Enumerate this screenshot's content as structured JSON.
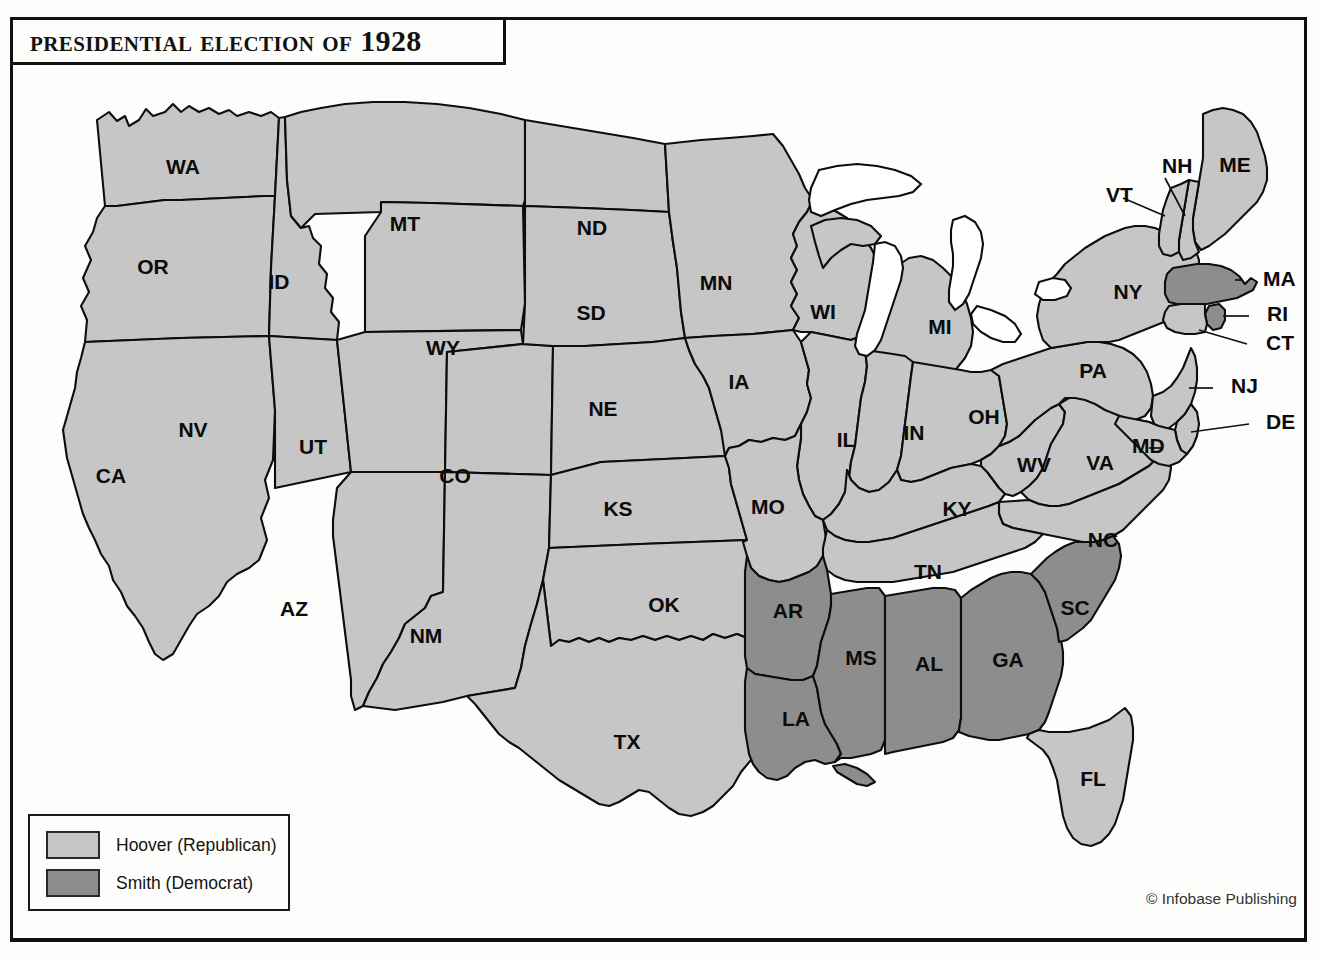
{
  "title": "Presidential Election of 1928",
  "credit": "© Infobase Publishing",
  "legend": {
    "items": [
      {
        "label": "Hoover (Republican)",
        "color": "#c6c6c6",
        "party": "Republican",
        "candidate": "Hoover"
      },
      {
        "label": "Smith (Democrat)",
        "color": "#8d8d8d",
        "party": "Democrat",
        "candidate": "Smith"
      }
    ]
  },
  "chart_data": {
    "type": "map",
    "title": "Presidential Election of 1928",
    "legend_position": "bottom-left",
    "categories": [
      "Hoover (Republican)",
      "Smith (Democrat)"
    ],
    "colors": {
      "Hoover (Republican)": "#c6c6c6",
      "Smith (Democrat)": "#8d8d8d"
    },
    "counts": {
      "Hoover (Republican)": 40,
      "Smith (Democrat)": 8
    },
    "states": [
      {
        "code": "WA",
        "winner": "Hoover (Republican)"
      },
      {
        "code": "OR",
        "winner": "Hoover (Republican)"
      },
      {
        "code": "CA",
        "winner": "Hoover (Republican)"
      },
      {
        "code": "ID",
        "winner": "Hoover (Republican)"
      },
      {
        "code": "NV",
        "winner": "Hoover (Republican)"
      },
      {
        "code": "MT",
        "winner": "Hoover (Republican)"
      },
      {
        "code": "WY",
        "winner": "Hoover (Republican)"
      },
      {
        "code": "UT",
        "winner": "Hoover (Republican)"
      },
      {
        "code": "AZ",
        "winner": "Hoover (Republican)"
      },
      {
        "code": "CO",
        "winner": "Hoover (Republican)"
      },
      {
        "code": "NM",
        "winner": "Hoover (Republican)"
      },
      {
        "code": "ND",
        "winner": "Hoover (Republican)"
      },
      {
        "code": "SD",
        "winner": "Hoover (Republican)"
      },
      {
        "code": "NE",
        "winner": "Hoover (Republican)"
      },
      {
        "code": "KS",
        "winner": "Hoover (Republican)"
      },
      {
        "code": "OK",
        "winner": "Hoover (Republican)"
      },
      {
        "code": "TX",
        "winner": "Hoover (Republican)"
      },
      {
        "code": "MN",
        "winner": "Hoover (Republican)"
      },
      {
        "code": "IA",
        "winner": "Hoover (Republican)"
      },
      {
        "code": "MO",
        "winner": "Hoover (Republican)"
      },
      {
        "code": "AR",
        "winner": "Smith (Democrat)"
      },
      {
        "code": "LA",
        "winner": "Smith (Democrat)"
      },
      {
        "code": "WI",
        "winner": "Hoover (Republican)"
      },
      {
        "code": "IL",
        "winner": "Hoover (Republican)"
      },
      {
        "code": "MS",
        "winner": "Smith (Democrat)"
      },
      {
        "code": "MI",
        "winner": "Hoover (Republican)"
      },
      {
        "code": "IN",
        "winner": "Hoover (Republican)"
      },
      {
        "code": "KY",
        "winner": "Hoover (Republican)"
      },
      {
        "code": "TN",
        "winner": "Hoover (Republican)"
      },
      {
        "code": "AL",
        "winner": "Smith (Democrat)"
      },
      {
        "code": "OH",
        "winner": "Hoover (Republican)"
      },
      {
        "code": "WV",
        "winner": "Hoover (Republican)"
      },
      {
        "code": "GA",
        "winner": "Smith (Democrat)"
      },
      {
        "code": "FL",
        "winner": "Hoover (Republican)"
      },
      {
        "code": "SC",
        "winner": "Smith (Democrat)"
      },
      {
        "code": "NC",
        "winner": "Hoover (Republican)"
      },
      {
        "code": "VA",
        "winner": "Hoover (Republican)"
      },
      {
        "code": "PA",
        "winner": "Hoover (Republican)"
      },
      {
        "code": "NY",
        "winner": "Hoover (Republican)"
      },
      {
        "code": "ME",
        "winner": "Hoover (Republican)"
      },
      {
        "code": "NH",
        "winner": "Hoover (Republican)"
      },
      {
        "code": "VT",
        "winner": "Hoover (Republican)"
      },
      {
        "code": "MA",
        "winner": "Smith (Democrat)"
      },
      {
        "code": "RI",
        "winner": "Smith (Democrat)"
      },
      {
        "code": "CT",
        "winner": "Hoover (Republican)"
      },
      {
        "code": "NJ",
        "winner": "Hoover (Republican)"
      },
      {
        "code": "DE",
        "winner": "Hoover (Republican)"
      },
      {
        "code": "MD",
        "winner": "Hoover (Republican)"
      }
    ]
  },
  "map": {
    "labels_inside": [
      {
        "code": "WA",
        "x": 170,
        "y": 148
      },
      {
        "code": "MT",
        "x": 392,
        "y": 205
      },
      {
        "code": "ND",
        "x": 579,
        "y": 209
      },
      {
        "code": "OR",
        "x": 140,
        "y": 248
      },
      {
        "code": "ID",
        "x": 266,
        "y": 263
      },
      {
        "code": "MN",
        "x": 703,
        "y": 264
      },
      {
        "code": "SD",
        "x": 578,
        "y": 294
      },
      {
        "code": "WI",
        "x": 810,
        "y": 293
      },
      {
        "code": "MI",
        "x": 927,
        "y": 308
      },
      {
        "code": "NY",
        "x": 1115,
        "y": 273
      },
      {
        "code": "ME",
        "x": 1222,
        "y": 146
      },
      {
        "code": "WY",
        "x": 430,
        "y": 329
      },
      {
        "code": "NE",
        "x": 590,
        "y": 390
      },
      {
        "code": "IA",
        "x": 726,
        "y": 363
      },
      {
        "code": "PA",
        "x": 1080,
        "y": 352
      },
      {
        "code": "NV",
        "x": 180,
        "y": 411
      },
      {
        "code": "UT",
        "x": 300,
        "y": 428
      },
      {
        "code": "CO",
        "x": 442,
        "y": 457
      },
      {
        "code": "IL",
        "x": 833,
        "y": 421
      },
      {
        "code": "IN",
        "x": 901,
        "y": 414
      },
      {
        "code": "OH",
        "x": 971,
        "y": 398
      },
      {
        "code": "CA",
        "x": 98,
        "y": 457
      },
      {
        "code": "KS",
        "x": 605,
        "y": 490
      },
      {
        "code": "MO",
        "x": 755,
        "y": 488
      },
      {
        "code": "WV",
        "x": 1021,
        "y": 446
      },
      {
        "code": "VA",
        "x": 1087,
        "y": 444
      },
      {
        "code": "KY",
        "x": 944,
        "y": 490
      },
      {
        "code": "NC",
        "x": 1090,
        "y": 521
      },
      {
        "code": "TN",
        "x": 915,
        "y": 553
      },
      {
        "code": "AZ",
        "x": 281,
        "y": 590
      },
      {
        "code": "NM",
        "x": 413,
        "y": 617
      },
      {
        "code": "OK",
        "x": 651,
        "y": 586
      },
      {
        "code": "AR",
        "x": 775,
        "y": 592
      },
      {
        "code": "SC",
        "x": 1062,
        "y": 589
      },
      {
        "code": "MS",
        "x": 848,
        "y": 639
      },
      {
        "code": "AL",
        "x": 916,
        "y": 645
      },
      {
        "code": "GA",
        "x": 995,
        "y": 641
      },
      {
        "code": "LA",
        "x": 783,
        "y": 700
      },
      {
        "code": "TX",
        "x": 614,
        "y": 723
      },
      {
        "code": "FL",
        "x": 1080,
        "y": 760
      }
    ],
    "labels_callout": [
      {
        "code": "NH",
        "x": 1149,
        "y": 147
      },
      {
        "code": "VT",
        "x": 1093,
        "y": 176
      },
      {
        "code": "MA",
        "x": 1250,
        "y": 260
      },
      {
        "code": "RI",
        "x": 1254,
        "y": 295
      },
      {
        "code": "CT",
        "x": 1253,
        "y": 324
      },
      {
        "code": "NJ",
        "x": 1218,
        "y": 367
      },
      {
        "code": "DE",
        "x": 1253,
        "y": 403
      },
      {
        "code": "MD",
        "x": 1119,
        "y": 427
      }
    ]
  }
}
